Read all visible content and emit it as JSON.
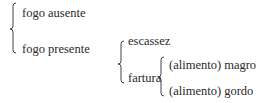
{
  "diagram": {
    "type": "tree-brace",
    "root": {
      "children": [
        {
          "label": "fogo ausente"
        },
        {
          "label": "fogo presente",
          "children": [
            {
              "label": "escassez"
            },
            {
              "label": "fartura",
              "children": [
                {
                  "label": "(alimento) magro"
                },
                {
                  "label": "(alimento) gordo"
                }
              ]
            }
          ]
        }
      ]
    }
  },
  "labels": {
    "fogo_ausente": "fogo ausente",
    "fogo_presente": "fogo presente",
    "escassez": "escassez",
    "fartura": "fartura",
    "magro": "(alimento) magro",
    "gordo": "(alimento) gordo"
  }
}
